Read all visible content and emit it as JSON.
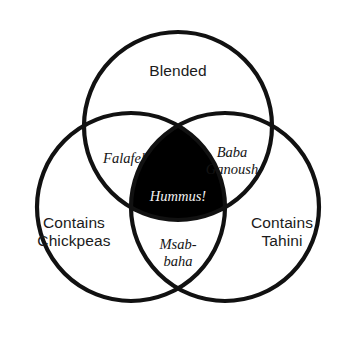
{
  "diagram": {
    "type": "venn",
    "background_color": "#ffffff",
    "stroke_color": "#111111",
    "fill_color": "#000000",
    "center_text_color": "#f2f2f2",
    "set_text_color": "#1b1b1b",
    "region_text_color": "#141414",
    "sets": [
      {
        "id": "blended",
        "label": "Blended",
        "cx": 178,
        "cy": 126,
        "r": 94
      },
      {
        "id": "chickpeas",
        "label": "Contains\nChickpeas",
        "cx": 131,
        "cy": 207,
        "r": 94
      },
      {
        "id": "tahini",
        "label": "Contains\nTahini",
        "cx": 225,
        "cy": 207,
        "r": 94
      }
    ],
    "regions": [
      {
        "id": "falafel",
        "label": "Falafel",
        "sets": [
          "blended",
          "chickpeas"
        ]
      },
      {
        "id": "baba-ganoush",
        "label": "Baba\nGanoush",
        "sets": [
          "blended",
          "tahini"
        ]
      },
      {
        "id": "msabbaha",
        "label": "Msab-\nbaha",
        "sets": [
          "chickpeas",
          "tahini"
        ]
      },
      {
        "id": "hummus",
        "label": "Hummus!",
        "sets": [
          "blended",
          "chickpeas",
          "tahini"
        ],
        "highlighted": true
      }
    ]
  }
}
